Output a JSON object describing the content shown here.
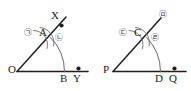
{
  "figure": {
    "stroke_color": "#1f1f1f",
    "arc_color": "#5a5a5a",
    "text_color": "#1b1b1b",
    "background": "#ffffff",
    "left_figure": {
      "name": "angle-XOY",
      "vertex_label": "O",
      "ray_end_label": "X",
      "baseline_end_label": "Y",
      "arc_foot_label": "B",
      "ray_point_label": "A",
      "mark_left": "㉠",
      "mark_right": "㉡"
    },
    "right_figure": {
      "name": "angle-P",
      "vertex_label": "P",
      "ray_end_label": "㉤",
      "baseline_end_label": "Q",
      "arc_foot_label": "D",
      "ray_point_label": "C",
      "mark_left": "㉢",
      "mark_right": "㉣"
    }
  }
}
